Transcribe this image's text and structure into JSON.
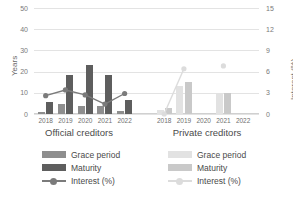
{
  "chart_data": {
    "type": "bar",
    "title": "",
    "ylabel": "Years",
    "ylabel_secondary": "Interest (%)",
    "xlabel": "",
    "ylim": [
      0,
      50
    ],
    "yticks": [
      0,
      10,
      20,
      30,
      40,
      50
    ],
    "ylim_secondary": [
      0,
      15
    ],
    "yticks_secondary": [
      0,
      3,
      6,
      9,
      12,
      15
    ],
    "grid": true,
    "legend_position": "bottom",
    "panels": [
      {
        "name": "official",
        "label": "Official creditors",
        "categories": [
          "2018",
          "2019",
          "2020",
          "2021",
          "2022"
        ],
        "series": [
          {
            "name": "Grace period",
            "axis": "left",
            "values": [
              1.0,
              4.6,
              3.9,
              3.7,
              1.5
            ]
          },
          {
            "name": "Maturity",
            "axis": "left",
            "values": [
              5.6,
              18.5,
              23.2,
              18.4,
              6.7
            ]
          },
          {
            "name": "Interest (%)",
            "axis": "right",
            "values": [
              2.6,
              3.4,
              2.7,
              1.4,
              2.9
            ]
          }
        ]
      },
      {
        "name": "private",
        "label": "Private creditors",
        "categories": [
          "2018",
          "2019",
          "2020",
          "2021",
          "2022"
        ],
        "series": [
          {
            "name": "Grace period",
            "axis": "left",
            "values": [
              2.1,
              13.3,
              0,
              10.0,
              0
            ]
          },
          {
            "name": "Maturity",
            "axis": "left",
            "values": [
              3.0,
              15.2,
              0,
              10.1,
              0
            ]
          },
          {
            "name": "Interest (%)",
            "axis": "right",
            "values": [
              0.0,
              6.4,
              null,
              6.8,
              null
            ]
          }
        ]
      }
    ]
  },
  "legend": {
    "official": [
      {
        "label": "Grace period",
        "type": "swatch",
        "color": "#8e8e8e"
      },
      {
        "label": "Maturity",
        "type": "swatch",
        "color": "#5e5e5e"
      },
      {
        "label": "Interest (%)",
        "type": "line",
        "color": "#7b7b7b"
      }
    ],
    "private": [
      {
        "label": "Grace period",
        "type": "swatch",
        "color": "#e2e2e2"
      },
      {
        "label": "Maturity",
        "type": "swatch",
        "color": "#c9c9c9"
      },
      {
        "label": "Interest (%)",
        "type": "line",
        "color": "#dcdcdc"
      }
    ]
  },
  "colors": {
    "grace_official": "#8e8e8e",
    "maturity_official": "#5e5e5e",
    "interest_official": "#7b7b7b",
    "grace_private": "#e2e2e2",
    "maturity_private": "#c9c9c9",
    "interest_private": "#dcdcdc",
    "grid": "#e3e3e3",
    "text": "#5a5a5a"
  }
}
